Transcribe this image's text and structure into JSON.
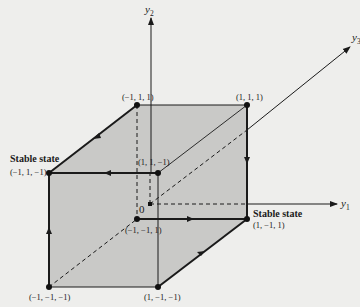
{
  "diagram": {
    "title": "",
    "axes": {
      "y1": {
        "label": "y",
        "subscript": "1"
      },
      "y2": {
        "label": "y",
        "subscript": "2"
      },
      "y3": {
        "label": "y",
        "subscript": "3"
      },
      "origin": "0"
    },
    "vertices": [
      {
        "id": "v_m1_1_1",
        "label": "(−1, 1, 1)"
      },
      {
        "id": "v_1_1_1",
        "label": "(1, 1, 1)"
      },
      {
        "id": "v_m1_1_m1",
        "label": "(−1, 1, −1)",
        "note": "Stable state"
      },
      {
        "id": "v_1_1_m1",
        "label": "(1, 1, −1)"
      },
      {
        "id": "v_m1_m1_1",
        "label": "(−1, −1, 1)"
      },
      {
        "id": "v_1_m1_1",
        "label": "(1, −1, 1)",
        "note": "Stable state"
      },
      {
        "id": "v_m1_m1_m1",
        "label": "(−1, −1, −1)"
      },
      {
        "id": "v_1_m1_m1",
        "label": "(1, −1, −1)"
      }
    ],
    "stable_state_label": "Stable state",
    "transitions": [
      {
        "from": "(−1, 1, 1)",
        "to": "(−1, 1, −1)"
      },
      {
        "from": "(1, 1, −1)",
        "to": "(−1, 1, −1)"
      },
      {
        "from": "(−1, −1, −1)",
        "to": "(−1, 1, −1)"
      },
      {
        "from": "(1, 1, 1)",
        "to": "(1, −1, 1)"
      },
      {
        "from": "(−1, −1, 1)",
        "to": "(1, −1, 1)"
      },
      {
        "from": "(1, −1, −1)",
        "to": "(1, −1, 1)"
      }
    ],
    "colors": {
      "background": "#eeeeec",
      "cube_fill": "#c9c9c7",
      "line": "#1a1a1a"
    }
  }
}
